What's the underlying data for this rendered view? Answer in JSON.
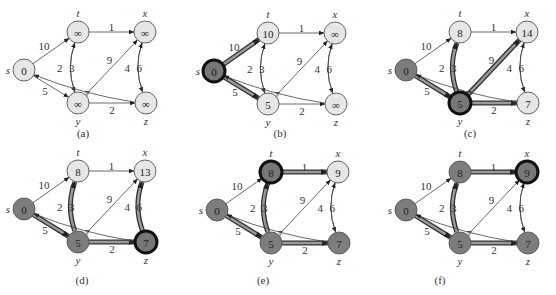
{
  "colors": {
    "white_node": "#e8e8e8",
    "gray_node": "#7a7a7a",
    "black_node_border": "#1a1a1a",
    "edge": "#333333",
    "shaded_edge": "#555555"
  },
  "vertices": [
    "s",
    "t",
    "x",
    "y",
    "z"
  ],
  "edges": [
    {
      "from": "s",
      "to": "t",
      "w": "10"
    },
    {
      "from": "s",
      "to": "y",
      "w": "5"
    },
    {
      "from": "t",
      "to": "x",
      "w": "1"
    },
    {
      "from": "t",
      "to": "y",
      "w": "2"
    },
    {
      "from": "y",
      "to": "t",
      "w": "3"
    },
    {
      "from": "y",
      "to": "x",
      "w": "9"
    },
    {
      "from": "y",
      "to": "z",
      "w": "2"
    },
    {
      "from": "x",
      "to": "z",
      "w": "4"
    },
    {
      "from": "z",
      "to": "x",
      "w": "6"
    },
    {
      "from": "z",
      "to": "s",
      "w": "7"
    }
  ],
  "panels": [
    {
      "caption": "(a)",
      "d": {
        "s": "0",
        "t": "∞",
        "x": "∞",
        "y": "∞",
        "z": "∞"
      },
      "state": {
        "s": "white",
        "t": "white",
        "x": "white",
        "y": "white",
        "z": "white"
      },
      "shaded": []
    },
    {
      "caption": "(b)",
      "d": {
        "s": "0",
        "t": "10",
        "x": "∞",
        "y": "5",
        "z": "∞"
      },
      "state": {
        "s": "black",
        "t": "white",
        "x": "white",
        "y": "white",
        "z": "white"
      },
      "shaded": [
        "s-t",
        "s-y"
      ]
    },
    {
      "caption": "(c)",
      "d": {
        "s": "0",
        "t": "8",
        "x": "14",
        "y": "5",
        "z": "7"
      },
      "state": {
        "s": "gray",
        "t": "white",
        "x": "white",
        "y": "black",
        "z": "white"
      },
      "shaded": [
        "s-y",
        "y-t",
        "y-x",
        "y-z"
      ]
    },
    {
      "caption": "(d)",
      "d": {
        "s": "0",
        "t": "8",
        "x": "13",
        "y": "5",
        "z": "7"
      },
      "state": {
        "s": "gray",
        "t": "white",
        "x": "white",
        "y": "gray",
        "z": "black"
      },
      "shaded": [
        "s-y",
        "y-t",
        "y-z",
        "z-x"
      ]
    },
    {
      "caption": "(e)",
      "d": {
        "s": "0",
        "t": "8",
        "x": "9",
        "y": "5",
        "z": "7"
      },
      "state": {
        "s": "gray",
        "t": "black",
        "x": "white",
        "y": "gray",
        "z": "gray"
      },
      "shaded": [
        "s-y",
        "y-t",
        "y-z",
        "t-x"
      ]
    },
    {
      "caption": "(f)",
      "d": {
        "s": "0",
        "t": "8",
        "x": "9",
        "y": "5",
        "z": "7"
      },
      "state": {
        "s": "gray",
        "t": "gray",
        "x": "black",
        "y": "gray",
        "z": "gray"
      },
      "shaded": [
        "s-y",
        "y-t",
        "y-z",
        "t-x"
      ]
    }
  ]
}
